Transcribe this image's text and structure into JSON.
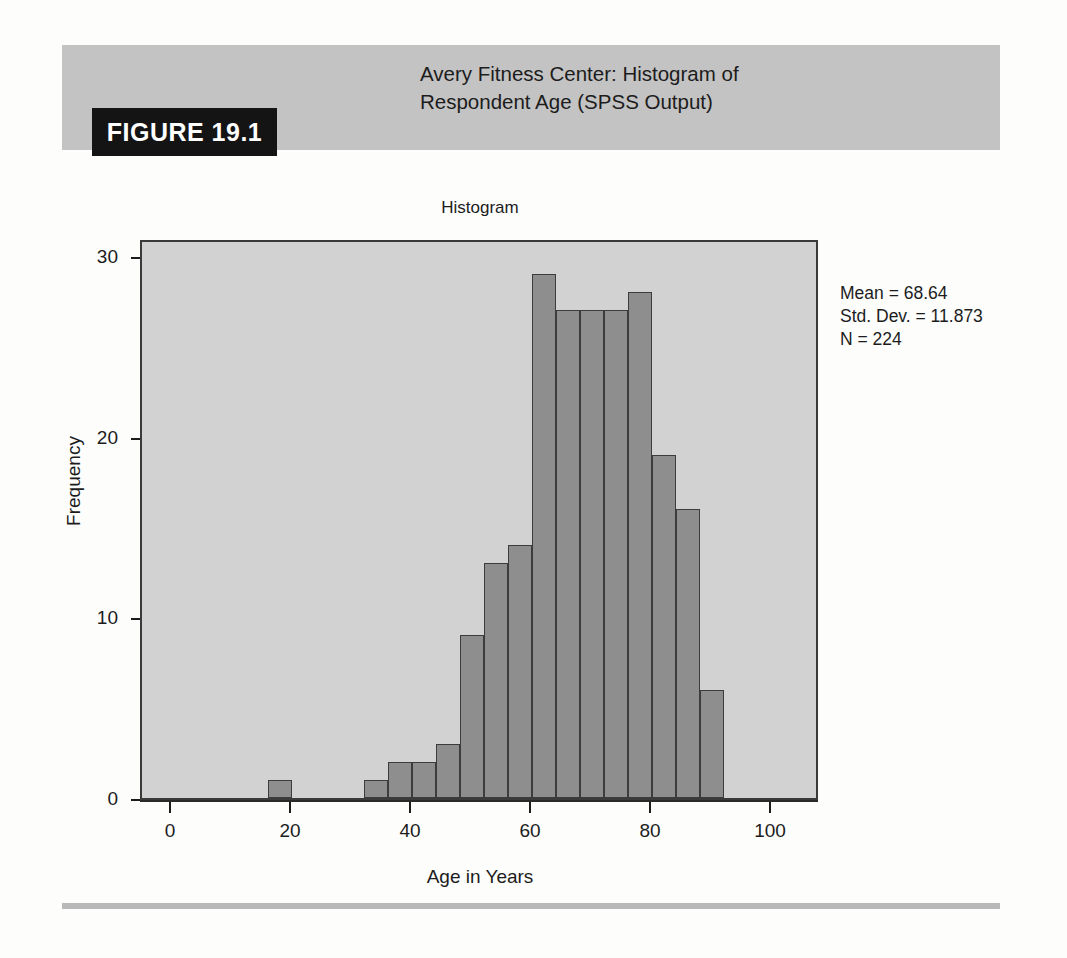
{
  "figure": {
    "tag": "FIGURE 19.1",
    "title": "Avery Fitness Center: Histogram of Respondent Age (SPSS Output)"
  },
  "colors": {
    "header_band": "#c3c3c3",
    "tag_background": "#141414",
    "tag_text": "#ffffff",
    "plot_background": "#d2d2d2",
    "bar_fill": "#8e8e8e",
    "bar_stroke": "#3c3c3c",
    "axis": "#1c1c1c",
    "footer_rule": "#b9b9b9"
  },
  "stats": {
    "mean_label": "Mean = 68.64",
    "std_dev_label": "Std. Dev. = 11.873",
    "n_label": "N = 224"
  },
  "chart_data": {
    "type": "bar",
    "title": "Histogram",
    "xlabel": "Age in Years",
    "ylabel": "Frequency",
    "xlim": [
      -5,
      108
    ],
    "ylim": [
      0,
      31
    ],
    "xticks": [
      0,
      20,
      40,
      60,
      80,
      100
    ],
    "xtick_labels": [
      "0",
      "20",
      "40",
      "60",
      "80",
      "100"
    ],
    "yticks": [
      0,
      10,
      20,
      30
    ],
    "ytick_labels": [
      "0",
      "10",
      "20",
      "30"
    ],
    "grid": false,
    "legend": false,
    "bin_width": 4,
    "bin_centers": [
      18,
      34,
      38,
      42,
      46,
      50,
      54,
      58,
      62,
      66,
      70,
      74,
      78,
      82,
      86,
      90
    ],
    "bin_starts": [
      16,
      32,
      36,
      40,
      44,
      48,
      52,
      56,
      60,
      64,
      68,
      72,
      76,
      80,
      84,
      88
    ],
    "categories": [
      "16-20",
      "32-36",
      "36-40",
      "40-44",
      "44-48",
      "48-52",
      "52-56",
      "56-60",
      "60-64",
      "64-68",
      "68-72",
      "72-76",
      "76-80",
      "80-84",
      "84-88",
      "88-92"
    ],
    "values": [
      1,
      1,
      2,
      2,
      3,
      9,
      13,
      14,
      29,
      27,
      27,
      27,
      28,
      19,
      16,
      6
    ],
    "annotations": [
      "Mean = 68.64",
      "Std. Dev. = 11.873",
      "N = 224"
    ]
  }
}
